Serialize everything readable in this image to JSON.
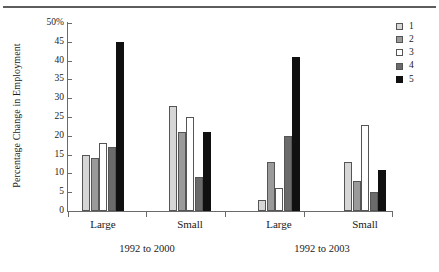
{
  "chart_data": {
    "type": "bar",
    "title": "",
    "xlabel": "",
    "ylabel": "Percentage Change in Employment",
    "ylim": [
      0,
      50
    ],
    "ytick_values": [
      0,
      5,
      10,
      15,
      20,
      25,
      30,
      35,
      40,
      45,
      50
    ],
    "ytick_labels": [
      "0",
      "5",
      "10",
      "15",
      "20",
      "25",
      "30",
      "35",
      "40",
      "45",
      "50%"
    ],
    "grid": false,
    "legend_position": "right",
    "legend_title": "",
    "categories": [
      "Large",
      "Small",
      "Large",
      "Small"
    ],
    "group_labels": [
      "1992 to 2000",
      "1992 to 2003"
    ],
    "series": [
      {
        "name": "1",
        "values": [
          15,
          28,
          3,
          13
        ]
      },
      {
        "name": "2",
        "values": [
          14,
          21,
          13,
          8
        ]
      },
      {
        "name": "3",
        "values": [
          18,
          25,
          6,
          23
        ]
      },
      {
        "name": "4",
        "values": [
          17,
          9,
          20,
          5
        ]
      },
      {
        "name": "5",
        "values": [
          45,
          21,
          41,
          11
        ]
      }
    ],
    "series_colors": [
      "#d6d6d6",
      "#9a9a9a",
      "#ffffff",
      "#6b6b6b",
      "#101010"
    ]
  },
  "axis": {
    "y_title": "Percentage Change in Employment"
  },
  "legend": {
    "items": [
      {
        "label": "1"
      },
      {
        "label": "2"
      },
      {
        "label": "3"
      },
      {
        "label": "4"
      },
      {
        "label": "5"
      }
    ]
  },
  "x_axis": {
    "categories": [
      {
        "label": "Large"
      },
      {
        "label": "Small"
      },
      {
        "label": "Large"
      },
      {
        "label": "Small"
      }
    ],
    "periods": [
      {
        "label": "1992 to 2000"
      },
      {
        "label": "1992 to 2003"
      }
    ]
  }
}
